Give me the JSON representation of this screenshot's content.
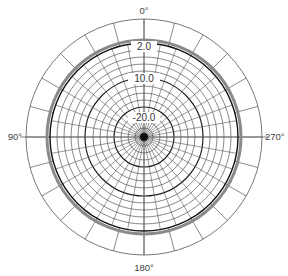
{
  "chart_data": {
    "type": "polar",
    "title": "",
    "angle_labels": [
      {
        "angle": 0,
        "text": "0°"
      },
      {
        "angle": 90,
        "text": "90°"
      },
      {
        "angle": 180,
        "text": "180°"
      },
      {
        "angle": 270,
        "text": "270°"
      }
    ],
    "radial_labels": [
      {
        "value": 2.0,
        "text": "2.0"
      },
      {
        "value": 10.0,
        "text": "10.0"
      },
      {
        "value": 20.0,
        "text": "20.0"
      }
    ],
    "radial_unit": "dB (attenuation)",
    "radial_ticks_db": [
      0,
      2,
      4,
      6,
      8,
      10,
      12,
      14,
      16,
      18,
      20,
      22,
      24
    ],
    "series": [
      {
        "name": "response-gray",
        "color": "#888888",
        "pattern": "omnidirectional",
        "db": 0.0
      },
      {
        "name": "response-black",
        "color": "#111111",
        "pattern": "omnidirectional",
        "db": -0.5
      }
    ],
    "grid": true,
    "legend": "none"
  },
  "layout": {
    "cx": 144,
    "cy": 137,
    "outer_r": 118,
    "gray_r": 97,
    "black_r": 94,
    "inner_rings": [
      87,
      80,
      73,
      66,
      59,
      51,
      44,
      37,
      30,
      23,
      16,
      9
    ],
    "dark_rings": [
      59,
      30
    ],
    "outer_spoke_step_deg": 15,
    "inner_spoke_step_deg": 10,
    "colors": {
      "grid": "#555555",
      "grid_dark": "#222222",
      "gray_series": "#8a8a8a",
      "black_series": "#111111",
      "text": "#444444"
    }
  },
  "labels": {
    "top": "0°",
    "left": "90°",
    "bottom": "180°",
    "right": "270°",
    "ring_2": "2.0",
    "ring_10": "10.0",
    "ring_20": "-20.0"
  }
}
